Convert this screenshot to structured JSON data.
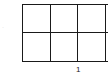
{
  "diagram": {
    "type": "grid",
    "rows": 2,
    "columns_visible": 3,
    "line_color": "#1a1a1a",
    "x_label": "1",
    "y_label": "·"
  }
}
